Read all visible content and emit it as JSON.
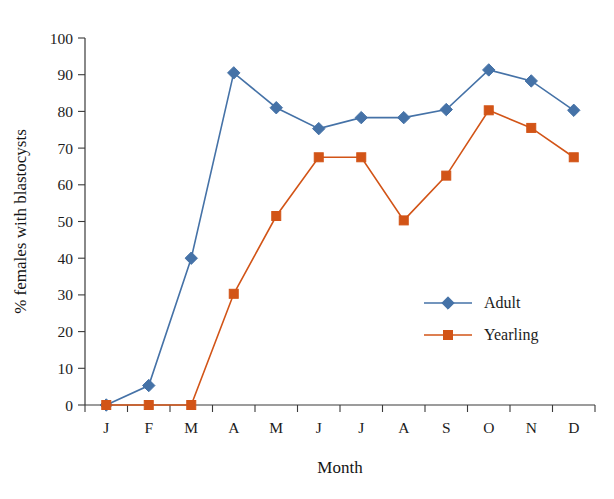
{
  "chart_data": {
    "type": "line",
    "title": "",
    "xlabel": "Month",
    "ylabel": "% females with blastocysts",
    "categories": [
      "J",
      "F",
      "M",
      "A",
      "M",
      "J",
      "J",
      "A",
      "S",
      "O",
      "N",
      "D"
    ],
    "xlim": [
      0,
      12
    ],
    "ylim": [
      0,
      100
    ],
    "yticks": [
      0,
      10,
      20,
      30,
      40,
      50,
      60,
      70,
      80,
      90,
      100
    ],
    "ytick_labels": [
      "0",
      "10",
      "20",
      "30",
      "40",
      "50",
      "60",
      "70",
      "80",
      "90",
      "100"
    ],
    "grid": false,
    "legend_position": "center-right",
    "series": [
      {
        "name": "Adult",
        "color": "#4572A7",
        "marker": "diamond",
        "values": [
          0,
          5.3,
          40.0,
          90.5,
          81.0,
          75.3,
          78.3,
          78.3,
          80.5,
          91.3,
          88.3,
          80.3
        ]
      },
      {
        "name": "Yearling",
        "color": "#D25417",
        "marker": "square",
        "values": [
          0,
          0,
          0,
          30.3,
          51.5,
          67.5,
          67.5,
          50.3,
          62.5,
          80.3,
          75.5,
          67.5
        ]
      }
    ]
  },
  "legend": {
    "entries": [
      {
        "label": "Adult",
        "color": "#4572A7",
        "marker": "diamond"
      },
      {
        "label": "Yearling",
        "color": "#D25417",
        "marker": "square"
      }
    ]
  }
}
